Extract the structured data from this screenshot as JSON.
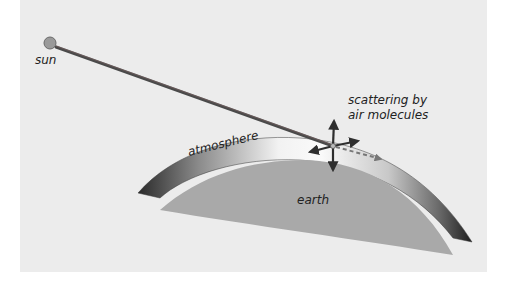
{
  "diagram": {
    "labels": {
      "sun": "sun",
      "scattering_line1": "scattering by",
      "scattering_line2": "air molecules",
      "atmosphere": "atmosphere",
      "earth": "earth"
    },
    "colors": {
      "background": "#ffffff",
      "panel": "#ececec",
      "sun_fill": "#9a9a9a",
      "sun_stroke": "#6a6a6a",
      "ray": "#4a4a4a",
      "earth": "#a9a9a9",
      "atmosphere_dark": "#2a2a2a",
      "atmosphere_light": "#f7f7f7",
      "arrow": "#3a3a3a",
      "text": "#222222"
    },
    "elements": [
      {
        "name": "sun",
        "shape": "circle",
        "cx": 50,
        "cy": 43,
        "r": 6
      },
      {
        "name": "sun-ray",
        "shape": "line",
        "from": [
          56,
          47
        ],
        "to": [
          333,
          146
        ]
      },
      {
        "name": "scattering-point",
        "cx": 333,
        "cy": 146
      },
      {
        "name": "atmosphere-layer",
        "shape": "arc-band"
      },
      {
        "name": "earth-surface",
        "shape": "arc-segment"
      }
    ]
  }
}
